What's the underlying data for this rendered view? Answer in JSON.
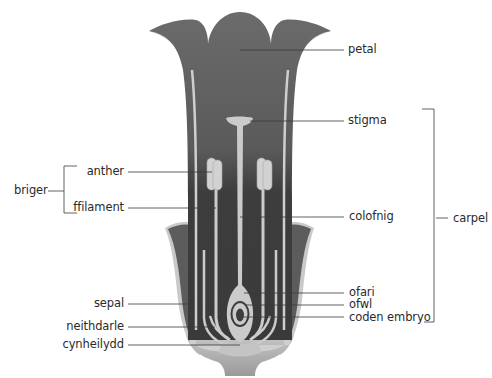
{
  "figure": {
    "title_cut": "",
    "colors": {
      "petal": "#6b6b6b",
      "tube_dark": "#3d3d3d",
      "sepal": "#5c5c5c",
      "light_tissue": "#cbcbcb",
      "receptacle_top": "#c2c2c2",
      "receptacle_bottom": "#9c9c9c",
      "leader_line": "#3a3a3a",
      "text": "#2a2a2a"
    }
  },
  "labels": {
    "left": {
      "briger": "briger",
      "anther": "anther",
      "ffilament": "ffilament",
      "sepal": "sepal",
      "neithdarle": "neithdarle",
      "cynheilydd": "cynheilydd"
    },
    "right": {
      "petal": "petal",
      "stigma": "stigma",
      "colofnig": "colofnig",
      "ofari": "ofari",
      "ofwl": "ofwl",
      "coden_embryo": "coden embryo",
      "carpel": "carpel"
    }
  },
  "groups": {
    "stamen": {
      "label": "briger",
      "members": [
        "anther",
        "ffilament"
      ]
    },
    "carpel": {
      "label": "carpel",
      "members": [
        "stigma",
        "colofnig",
        "ofari",
        "ofwl",
        "coden embryo"
      ]
    }
  }
}
